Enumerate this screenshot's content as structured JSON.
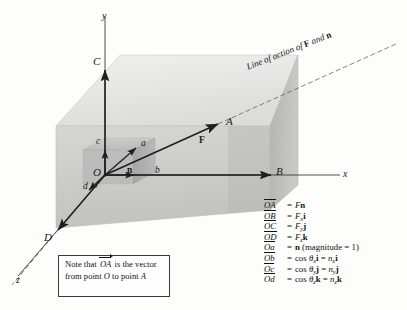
{
  "figure": {
    "caption_line_of_action": "Line of action of",
    "caption_loa_F": "F",
    "caption_loa_and": "and",
    "caption_loa_n": "n"
  },
  "axes": [
    {
      "name": "y-axis",
      "label": "y"
    },
    {
      "name": "x-axis",
      "label": "x"
    },
    {
      "name": "z-axis",
      "label": "z"
    }
  ],
  "points": {
    "origin": "O",
    "A": "A",
    "B": "B",
    "C": "C",
    "D": "D",
    "a": "a",
    "b": "b",
    "c": "c",
    "d": "d",
    "force": "F",
    "unit_normal": "n"
  },
  "note": {
    "line1_pre": "Note that",
    "line1_vec": "OA",
    "line1_post": "is the",
    "line2": "vector from point",
    "line2_pt": "O",
    "line3_pre": "to point",
    "line3_pt": "A"
  },
  "equations": [
    {
      "lhs": "OA",
      "rhs_parts": [
        {
          "t": "F",
          "s": "it"
        },
        {
          "t": "n",
          "s": "bf"
        }
      ]
    },
    {
      "lhs": "OB",
      "rhs_parts": [
        {
          "t": "F",
          "s": "it"
        },
        {
          "t": "x",
          "s": "sub"
        },
        {
          "t": "i",
          "s": "bf"
        }
      ]
    },
    {
      "lhs": "OC",
      "rhs_parts": [
        {
          "t": "F",
          "s": "it"
        },
        {
          "t": "y",
          "s": "sub"
        },
        {
          "t": "j",
          "s": "bf"
        }
      ]
    },
    {
      "lhs": "OD",
      "rhs_parts": [
        {
          "t": "F",
          "s": "it"
        },
        {
          "t": "z",
          "s": "sub"
        },
        {
          "t": "k",
          "s": "bf"
        }
      ]
    },
    {
      "lhs": "Oa",
      "rhs_parts": [
        {
          "t": "n",
          "s": "bf"
        },
        {
          "t": " (magnitude = 1)",
          "s": "rm"
        }
      ]
    },
    {
      "lhs": "Ob",
      "rhs_parts": [
        {
          "t": "cos ",
          "s": "rm"
        },
        {
          "t": "θ",
          "s": "it"
        },
        {
          "t": "x",
          "s": "sub"
        },
        {
          "t": "i",
          "s": "bf"
        },
        {
          "t": " = ",
          "s": "rm"
        },
        {
          "t": "n",
          "s": "it"
        },
        {
          "t": "x",
          "s": "sub"
        },
        {
          "t": "i",
          "s": "bf"
        }
      ]
    },
    {
      "lhs": "Oc",
      "rhs_parts": [
        {
          "t": "cos ",
          "s": "rm"
        },
        {
          "t": "θ",
          "s": "it"
        },
        {
          "t": "y",
          "s": "sub"
        },
        {
          "t": "j",
          "s": "bf"
        },
        {
          "t": " = ",
          "s": "rm"
        },
        {
          "t": "n",
          "s": "it"
        },
        {
          "t": "y",
          "s": "sub"
        },
        {
          "t": "j",
          "s": "bf"
        }
      ]
    },
    {
      "lhs": "Od",
      "rhs_parts": [
        {
          "t": "cos ",
          "s": "rm"
        },
        {
          "t": "θ",
          "s": "it"
        },
        {
          "t": "z",
          "s": "sub"
        },
        {
          "t": "k",
          "s": "bf"
        },
        {
          "t": " = ",
          "s": "rm"
        },
        {
          "t": "n",
          "s": "it"
        },
        {
          "t": "z",
          "s": "sub"
        },
        {
          "t": "k",
          "s": "bf"
        }
      ]
    }
  ],
  "equals_sign": "=",
  "colors": {
    "background": "#fdfdfc",
    "box_front_face": "#cfcfcf",
    "box_top_face": "#e4e4e4",
    "box_right_face": "#bcbcbc",
    "inner_box_top": "#c2c2c2",
    "inner_box_front": "#b5b5b5",
    "inner_box_side": "#a9a9a9",
    "line": "#1f1f1f",
    "text": "#141414"
  }
}
